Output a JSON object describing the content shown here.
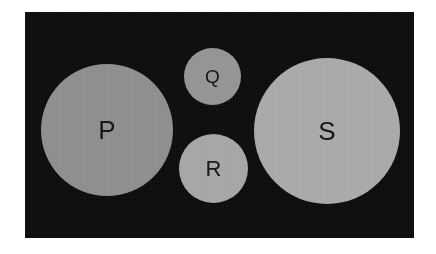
{
  "figure": {
    "type": "diagram",
    "panel": {
      "background_color": "#0d0d0d",
      "x": 25,
      "y": 12,
      "width": 389,
      "height": 226
    },
    "page_background_color": "#ffffff",
    "label_color": "#151515"
  },
  "circles": [
    {
      "id": "circle-p",
      "label": "P",
      "center_x": 107,
      "center_y": 130,
      "diameter": 132,
      "radius": 66,
      "fill_color": "#8e8e8e",
      "label_size_class": "lbl-lg"
    },
    {
      "id": "circle-q",
      "label": "Q",
      "center_x": 212,
      "center_y": 76,
      "diameter": 57,
      "radius": 28,
      "fill_color": "#949494",
      "label_size_class": "lbl-sm"
    },
    {
      "id": "circle-r",
      "label": "R",
      "center_x": 213,
      "center_y": 168,
      "diameter": 69,
      "radius": 34,
      "fill_color": "#a6a6a6",
      "label_size_class": "lbl-md"
    },
    {
      "id": "circle-s",
      "label": "S",
      "center_x": 327,
      "center_y": 131,
      "diameter": 146,
      "radius": 73,
      "fill_color": "#a9a9a9",
      "label_size_class": "lbl-lg"
    }
  ]
}
